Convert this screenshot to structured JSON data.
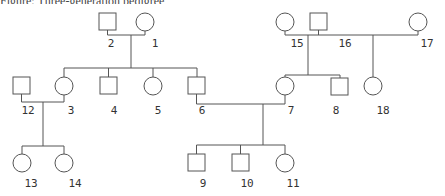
{
  "caption": {
    "text": "Figure: Three-generation pedigree",
    "visible": "clipped"
  },
  "diagram": {
    "type": "pedigree",
    "line_color": "#555555",
    "individuals": [
      {
        "id": "1",
        "sex": "female",
        "shape": "circle",
        "generation": 1
      },
      {
        "id": "2",
        "sex": "male",
        "shape": "square",
        "generation": 1
      },
      {
        "id": "15",
        "sex": "female",
        "shape": "circle",
        "generation": 1
      },
      {
        "id": "16",
        "sex": "male",
        "shape": "square",
        "generation": 1
      },
      {
        "id": "17",
        "sex": "female",
        "shape": "circle",
        "generation": 1
      },
      {
        "id": "12",
        "sex": "male",
        "shape": "square",
        "generation": 2
      },
      {
        "id": "3",
        "sex": "female",
        "shape": "circle",
        "generation": 2
      },
      {
        "id": "4",
        "sex": "male",
        "shape": "square",
        "generation": 2
      },
      {
        "id": "5",
        "sex": "female",
        "shape": "circle",
        "generation": 2
      },
      {
        "id": "6",
        "sex": "male",
        "shape": "square",
        "generation": 2
      },
      {
        "id": "7",
        "sex": "female",
        "shape": "circle",
        "generation": 2
      },
      {
        "id": "8",
        "sex": "male",
        "shape": "square",
        "generation": 2
      },
      {
        "id": "18",
        "sex": "female",
        "shape": "circle",
        "generation": 2
      },
      {
        "id": "13",
        "sex": "female",
        "shape": "circle",
        "generation": 3
      },
      {
        "id": "14",
        "sex": "female",
        "shape": "circle",
        "generation": 3
      },
      {
        "id": "9",
        "sex": "male",
        "shape": "square",
        "generation": 3
      },
      {
        "id": "10",
        "sex": "male",
        "shape": "square",
        "generation": 3
      },
      {
        "id": "11",
        "sex": "female",
        "shape": "circle",
        "generation": 3
      }
    ],
    "matings": [
      {
        "partners": [
          "2",
          "1"
        ],
        "children": [
          "3",
          "4",
          "5",
          "6"
        ]
      },
      {
        "partners": [
          "15",
          "16"
        ],
        "children": [
          "7",
          "8"
        ]
      },
      {
        "partners": [
          "16",
          "17"
        ],
        "children": [
          "18"
        ]
      },
      {
        "partners": [
          "12",
          "3"
        ],
        "children": [
          "13",
          "14"
        ]
      },
      {
        "partners": [
          "6",
          "7"
        ],
        "children": [
          "9",
          "10",
          "11"
        ]
      }
    ],
    "labels": {
      "n1": "1",
      "n2": "2",
      "n3": "3",
      "n4": "4",
      "n5": "5",
      "n6": "6",
      "n7": "7",
      "n8": "8",
      "n9": "9",
      "n10": "10",
      "n11": "11",
      "n12": "12",
      "n13": "13",
      "n14": "14",
      "n15": "15",
      "n16": "16",
      "n17": "17",
      "n18": "18"
    }
  }
}
